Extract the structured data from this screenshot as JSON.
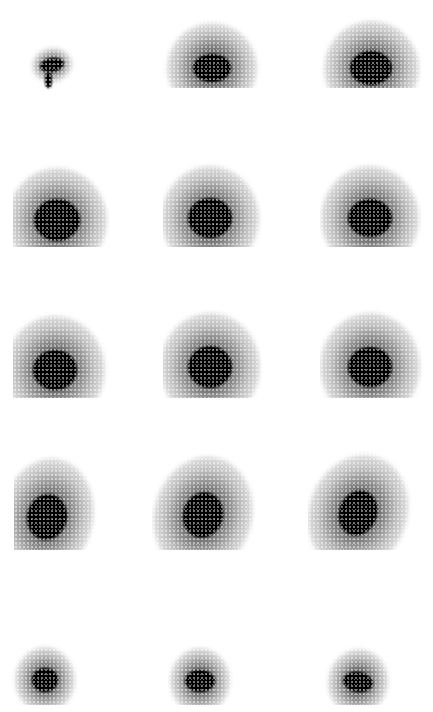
{
  "image": {
    "width": 433,
    "height": 712,
    "background": "#ffffff",
    "spot_color": "#000000",
    "grid": {
      "rows": 5,
      "cols": 3
    }
  },
  "spots": [
    {
      "row": 1,
      "col": 1,
      "cx": 52,
      "cy": 65,
      "core_w": 24,
      "core_h": 14,
      "halo_w": 40,
      "halo_h": 34,
      "rot": -10,
      "clip": [
        20,
        30,
        90,
        90
      ],
      "tail": {
        "x": 45,
        "y": 72,
        "w": 7,
        "h": 16
      }
    },
    {
      "row": 1,
      "col": 2,
      "cx": 212,
      "cy": 68,
      "core_w": 38,
      "core_h": 28,
      "halo_w": 90,
      "halo_h": 90,
      "rot": 0,
      "clip": [
        160,
        5,
        270,
        88
      ],
      "tail": null
    },
    {
      "row": 1,
      "col": 3,
      "cx": 371,
      "cy": 68,
      "core_w": 42,
      "core_h": 34,
      "halo_w": 95,
      "halo_h": 95,
      "rot": 0,
      "clip": [
        315,
        5,
        425,
        88
      ],
      "tail": null
    },
    {
      "row": 2,
      "col": 1,
      "cx": 57,
      "cy": 220,
      "core_w": 46,
      "core_h": 42,
      "halo_w": 100,
      "halo_h": 105,
      "rot": 0,
      "clip": [
        13,
        150,
        110,
        247
      ],
      "tail": null
    },
    {
      "row": 2,
      "col": 2,
      "cx": 210,
      "cy": 218,
      "core_w": 44,
      "core_h": 40,
      "halo_w": 98,
      "halo_h": 105,
      "rot": 0,
      "clip": [
        163,
        150,
        262,
        247
      ],
      "tail": null
    },
    {
      "row": 2,
      "col": 3,
      "cx": 370,
      "cy": 218,
      "core_w": 44,
      "core_h": 38,
      "halo_w": 98,
      "halo_h": 105,
      "rot": 0,
      "clip": [
        320,
        150,
        422,
        247
      ],
      "tail": null
    },
    {
      "row": 3,
      "col": 1,
      "cx": 55,
      "cy": 370,
      "core_w": 44,
      "core_h": 40,
      "halo_w": 100,
      "halo_h": 108,
      "rot": 0,
      "clip": [
        13,
        300,
        110,
        398
      ],
      "tail": null
    },
    {
      "row": 3,
      "col": 2,
      "cx": 210,
      "cy": 367,
      "core_w": 44,
      "core_h": 42,
      "halo_w": 100,
      "halo_h": 108,
      "rot": 0,
      "clip": [
        163,
        300,
        262,
        398
      ],
      "tail": null
    },
    {
      "row": 3,
      "col": 3,
      "cx": 370,
      "cy": 367,
      "core_w": 44,
      "core_h": 40,
      "halo_w": 100,
      "halo_h": 108,
      "rot": 0,
      "clip": [
        320,
        300,
        422,
        398
      ],
      "tail": null
    },
    {
      "row": 4,
      "col": 1,
      "cx": 47,
      "cy": 517,
      "core_w": 40,
      "core_h": 46,
      "halo_w": 92,
      "halo_h": 118,
      "rot": 12,
      "clip": [
        14,
        445,
        100,
        550
      ],
      "tail": null
    },
    {
      "row": 4,
      "col": 2,
      "cx": 203,
      "cy": 515,
      "core_w": 40,
      "core_h": 46,
      "halo_w": 98,
      "halo_h": 118,
      "rot": 15,
      "clip": [
        152,
        445,
        258,
        550
      ],
      "tail": null
    },
    {
      "row": 4,
      "col": 3,
      "cx": 358,
      "cy": 513,
      "core_w": 38,
      "core_h": 46,
      "halo_w": 98,
      "halo_h": 118,
      "rot": 20,
      "clip": [
        308,
        445,
        412,
        550
      ],
      "tail": null
    },
    {
      "row": 5,
      "col": 1,
      "cx": 45,
      "cy": 680,
      "core_w": 26,
      "core_h": 24,
      "halo_w": 60,
      "halo_h": 66,
      "rot": 0,
      "clip": [
        12,
        640,
        80,
        705
      ],
      "tail": null
    },
    {
      "row": 5,
      "col": 2,
      "cx": 200,
      "cy": 681,
      "core_w": 30,
      "core_h": 22,
      "halo_w": 60,
      "halo_h": 66,
      "rot": 0,
      "clip": [
        168,
        640,
        235,
        705
      ],
      "tail": null
    },
    {
      "row": 5,
      "col": 3,
      "cx": 358,
      "cy": 682,
      "core_w": 30,
      "core_h": 20,
      "halo_w": 60,
      "halo_h": 66,
      "rot": 10,
      "clip": [
        322,
        640,
        395,
        705
      ],
      "tail": null
    }
  ]
}
